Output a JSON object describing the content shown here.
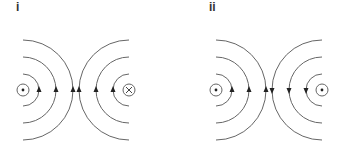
{
  "panels": [
    {
      "label": "i",
      "left_source": "dot",
      "right_source": "cross",
      "left_arrows": "up",
      "right_arrows": "up"
    },
    {
      "label": "ii",
      "left_source": "dot",
      "right_source": "dot",
      "left_arrows": "up",
      "right_arrows": "down"
    }
  ],
  "colors": {
    "line": "#666666",
    "arrow": "#222222",
    "label": "#333333"
  }
}
